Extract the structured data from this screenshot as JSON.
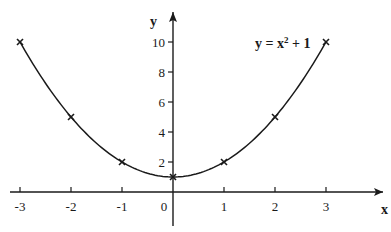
{
  "chart_data": {
    "type": "line",
    "title": "",
    "annotation": "y = x² + 1",
    "xlabel": "x",
    "ylabel": "y",
    "x": [
      -3,
      -2,
      -1,
      0,
      1,
      2,
      3
    ],
    "series": [
      {
        "name": "y = x² + 1",
        "values": [
          10,
          5,
          2,
          1,
          2,
          5,
          10
        ]
      }
    ],
    "x_ticks": [
      "-3",
      "-2",
      "-1",
      "0",
      "1",
      "2",
      "3"
    ],
    "y_ticks": [
      "2",
      "4",
      "6",
      "8",
      "10"
    ],
    "xlim": [
      -3.2,
      3.5
    ],
    "ylim": [
      0,
      11.5
    ],
    "grid": false,
    "marker": "x"
  },
  "colors": {
    "ink": "#1a1a1a",
    "background": "#ffffff"
  }
}
